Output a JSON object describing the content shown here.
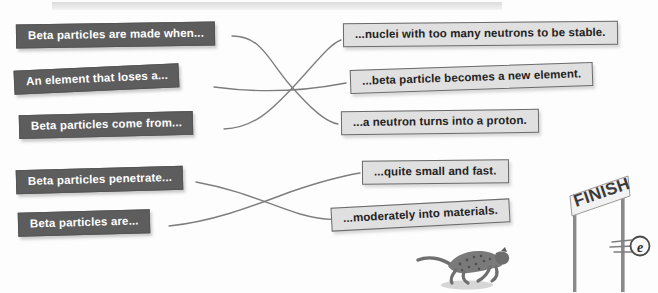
{
  "exercise": {
    "type": "matching-activity",
    "topic": "Beta particles",
    "top_band": {
      "name": "header-rule"
    },
    "prompts": [
      {
        "id": "p1",
        "label": "Beta particles are made when..."
      },
      {
        "id": "p2",
        "label": "An element that loses a..."
      },
      {
        "id": "p3",
        "label": "Beta particles come from..."
      },
      {
        "id": "p4",
        "label": "Beta particles penetrate..."
      },
      {
        "id": "p5",
        "label": "Beta particles are..."
      }
    ],
    "answers": [
      {
        "id": "a1",
        "label": "...nuclei with too many neutrons to be stable."
      },
      {
        "id": "a2",
        "label": "...beta particle becomes a new element."
      },
      {
        "id": "a3",
        "label": "...a neutron turns into a proton."
      },
      {
        "id": "a4",
        "label": "...quite small and fast."
      },
      {
        "id": "a5",
        "label": "...moderately into materials."
      }
    ],
    "connections": [
      {
        "from": "p1",
        "to": "a3"
      },
      {
        "from": "p2",
        "to": "a2"
      },
      {
        "from": "p3",
        "to": "a1"
      },
      {
        "from": "p4",
        "to": "a5"
      },
      {
        "from": "p5",
        "to": "a4"
      }
    ]
  },
  "illustration": {
    "finish_sign_label": "FINISH",
    "electron_label": "e",
    "cheetah": "running-cheetah"
  },
  "colors": {
    "prompt_bg": "#5d5d5d",
    "prompt_text": "#ffffff",
    "answer_bg": "#e0e0e0",
    "answer_text": "#232323",
    "answer_border": "#6b6b6b",
    "connector_line": "#7d7d7d",
    "band": "#dcdcdc",
    "page_bg": "#fdfdfd"
  }
}
